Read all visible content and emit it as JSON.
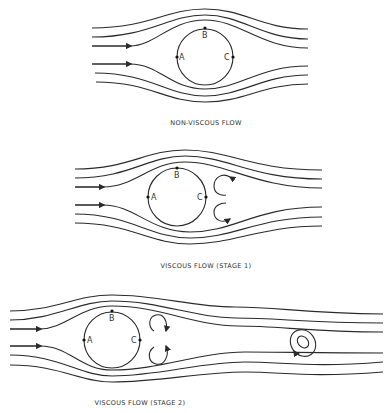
{
  "panels": [
    {
      "id": "non-viscous",
      "caption": "NON-VISCOUS FLOW",
      "points": {
        "A": "A",
        "B": "B",
        "C": "C"
      }
    },
    {
      "id": "viscous-stage-1",
      "caption": "VISCOUS FLOW (STAGE 1)",
      "points": {
        "A": "A",
        "B": "B",
        "C": "C"
      }
    },
    {
      "id": "viscous-stage-2",
      "caption": "VISCOUS FLOW (STAGE 2)",
      "points": {
        "A": "A",
        "B": "B",
        "C": "C"
      }
    }
  ],
  "colors": {
    "stroke": "#2a2a2a",
    "background": "#ffffff"
  }
}
